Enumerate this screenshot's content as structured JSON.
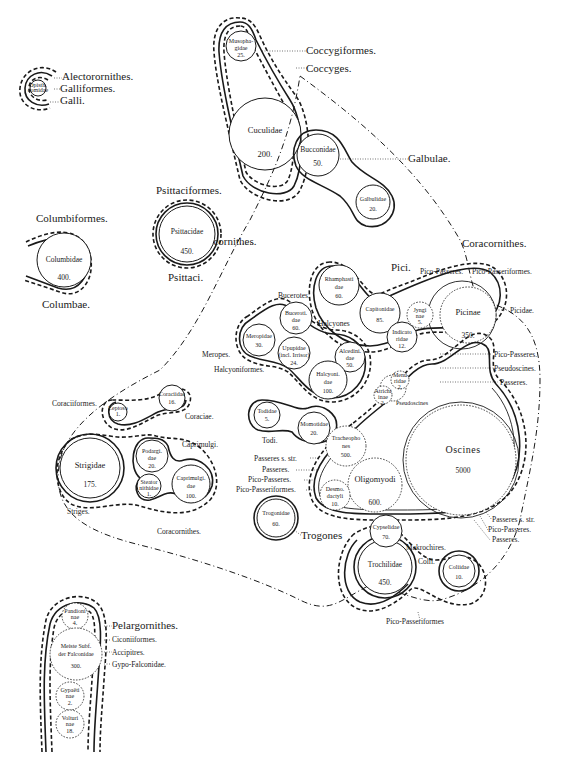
{
  "diagram": {
    "kind": "bird-classification-circle-diagram",
    "clusters": {
      "galli": {
        "labels": [
          "Alectorornithes.",
          "Galliformes.",
          "Galli."
        ],
        "families": [
          {
            "name": "Opisthocomidae",
            "count": ""
          }
        ]
      },
      "coccyges": {
        "labels": [
          "Coccygiformes.",
          "Coccyges."
        ],
        "families": [
          {
            "name_lines": [
              "Musopha-",
              "gidae"
            ],
            "count": "25."
          },
          {
            "name_lines": [
              "Cuculidae"
            ],
            "count": "200."
          }
        ]
      },
      "galbulae": {
        "labels": [
          "Galbulae."
        ],
        "families": [
          {
            "name_lines": [
              "Bucconidae"
            ],
            "count": "50."
          },
          {
            "name_lines": [
              "Galbulidae"
            ],
            "count": "20."
          }
        ]
      },
      "coracornithes_main": {
        "label": "Coracornithes."
      },
      "columbae": {
        "labels": [
          "Columbiformes.",
          "Columbae."
        ],
        "families": [
          {
            "name_lines": [
              "Columbidae"
            ],
            "count": "400."
          }
        ]
      },
      "psittaci": {
        "labels": [
          "Psittaciformes.",
          "Psittaci."
        ],
        "families": [
          {
            "name_lines": [
              "Psittacidae"
            ],
            "count": "450."
          }
        ]
      },
      "pici": {
        "labels": [
          "Pici.",
          "Pico-Passeres.",
          "Pico-Passeriformes.",
          "Picidae.",
          "Coracornithes."
        ],
        "families": [
          {
            "name_lines": [
              "Rhamphasti",
              "dae"
            ],
            "count": "60."
          },
          {
            "name_lines": [
              "Capitonidae"
            ],
            "count": "85."
          },
          {
            "name_lines": [
              "Indicato",
              "ridae"
            ],
            "count": "12."
          },
          {
            "name_lines": [
              "Jyngi",
              "nae"
            ],
            "count": "5."
          },
          {
            "name_lines": [
              "Picinae"
            ],
            "count": "350."
          }
        ]
      },
      "halcyones": {
        "labels": [
          "Bucerotes.",
          "Halcyones",
          "Meropes.",
          "Halcyoniformes."
        ],
        "families": [
          {
            "name_lines": [
              "Meropidae"
            ],
            "count": "30."
          },
          {
            "name_lines": [
              "Buceroti.",
              "dae"
            ],
            "count": "60."
          },
          {
            "name_lines": [
              "Upupidae",
              "(incl. Irrisor)"
            ],
            "count": "24."
          },
          {
            "name_lines": [
              "Alcedini.",
              "dae"
            ],
            "count": "50."
          },
          {
            "name_lines": [
              "Halcyoni.",
              "dae"
            ],
            "count": "100."
          }
        ]
      },
      "todi": {
        "labels": [
          "Todi."
        ],
        "families": [
          {
            "name_lines": [
              "Todidae"
            ],
            "count": "5."
          },
          {
            "name_lines": [
              "Momotidae"
            ],
            "count": "20."
          }
        ]
      },
      "passeres": {
        "labels_right": [
          "Pico-Passeres.",
          "Pseudoscines.",
          "Passeres."
        ],
        "labels_left": [
          "Passeres s. str.",
          "Passeres.",
          "Pico-Passeres.",
          "Pico-Passeriformes."
        ],
        "labels_bottom_right": [
          "Passeres s. str.",
          "Pico-Passeres.",
          "Passeres."
        ],
        "families": [
          {
            "name_lines": [
              "Menu",
              "ridae"
            ],
            "count": "2."
          },
          {
            "name_lines": [
              "Atrichi",
              "inae"
            ],
            "count": "2."
          },
          {
            "name_lines": [
              "Pseudoscines"
            ],
            "count": ""
          },
          {
            "name_lines": [
              "Tracheopho",
              "nes"
            ],
            "count": "500."
          },
          {
            "name_lines": [
              "Oscines"
            ],
            "count": "5000"
          },
          {
            "name_lines": [
              "Oligomyodi"
            ],
            "count": "600."
          },
          {
            "name_lines": [
              "Desmo.",
              "dactyli"
            ],
            "count": "10."
          }
        ]
      },
      "coraciae": {
        "labels": [
          "Coraciiformes.",
          "Coraciae.",
          "Caprimulgi.",
          "Striges.",
          "Coracornithes."
        ],
        "families": [
          {
            "name_lines": [
              "Leptoso",
              "matidae"
            ],
            "count": "1."
          },
          {
            "name_lines": [
              "Coraciidae"
            ],
            "count": "16."
          },
          {
            "name_lines": [
              "Strigidae"
            ],
            "count": "175."
          },
          {
            "name_lines": [
              "Podargi.",
              "dae"
            ],
            "count": "20."
          },
          {
            "name_lines": [
              "Steator",
              "nithidae"
            ],
            "count": "1."
          },
          {
            "name_lines": [
              "Caprimulgi.",
              "dae"
            ],
            "count": "100."
          }
        ]
      },
      "trogones": {
        "labels": [
          "Trogones"
        ],
        "families": [
          {
            "name_lines": [
              "Trogonidae"
            ],
            "count": "60."
          }
        ]
      },
      "macrochires": {
        "labels": [
          "Makrochires.",
          "Colii.",
          "Pico-Passeriformes"
        ],
        "families": [
          {
            "name_lines": [
              "Cypselidae"
            ],
            "count": "70."
          },
          {
            "name_lines": [
              "Trochilidae"
            ],
            "count": "450."
          },
          {
            "name_lines": [
              "Coliidae"
            ],
            "count": "10."
          }
        ]
      },
      "accipitres": {
        "labels": [
          "Pelargornithes.",
          "Ciconiiformes.",
          "Accipitres.",
          "Gypo-Falconidae."
        ],
        "families": [
          {
            "name_lines": [
              "Pandioni",
              "nae"
            ],
            "count": "4."
          },
          {
            "name_lines": [
              "Meiste Subf.",
              "der Falconidae"
            ],
            "count": "300."
          },
          {
            "name_lines": [
              "Gypaëti",
              "nae"
            ],
            "count": "2."
          },
          {
            "name_lines": [
              "Volturi",
              "nae"
            ],
            "count": "18."
          }
        ]
      }
    }
  }
}
